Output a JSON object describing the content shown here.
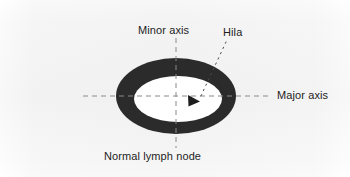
{
  "figure": {
    "title": "Normal lymph node",
    "caption": "Normal lymph node",
    "background_color": "#ffffff",
    "ink_color": "#2b2b2b",
    "axis_line_color": "#808080",
    "labels": {
      "minor_axis": "Minor axis",
      "major_axis": "Major axis",
      "hila": "Hila"
    },
    "shapes": {
      "node_outer_ellipse": {
        "name": "lymph-node-cortex",
        "center_x": 176,
        "center_y": 96,
        "radius_x": 60,
        "radius_y": 38,
        "fill": "#2b2b2b"
      },
      "node_inner_ellipse": {
        "name": "lymph-node-medulla",
        "center_x": 178,
        "center_y": 99,
        "radius_x": 44,
        "radius_y": 23,
        "fill": "#ffffff"
      },
      "major_axis_line": {
        "name": "major-axis-dashed-line",
        "x1": 83,
        "y1": 96,
        "x2": 270,
        "y2": 96,
        "style": "dashed"
      },
      "minor_axis_line": {
        "name": "minor-axis-dashed-line",
        "x1": 176,
        "y1": 38,
        "x2": 176,
        "y2": 148,
        "style": "dashed"
      },
      "hila_leader_line": {
        "name": "hila-leader-dotted-line",
        "x1": 226,
        "y1": 42,
        "x2": 199,
        "y2": 99,
        "style": "dotted"
      },
      "hila_marker": {
        "name": "hila-arrowhead-marker",
        "tip_x": 199,
        "tip_y": 101,
        "shape": "triangle-right",
        "fill": "#1d1d1d"
      }
    }
  }
}
